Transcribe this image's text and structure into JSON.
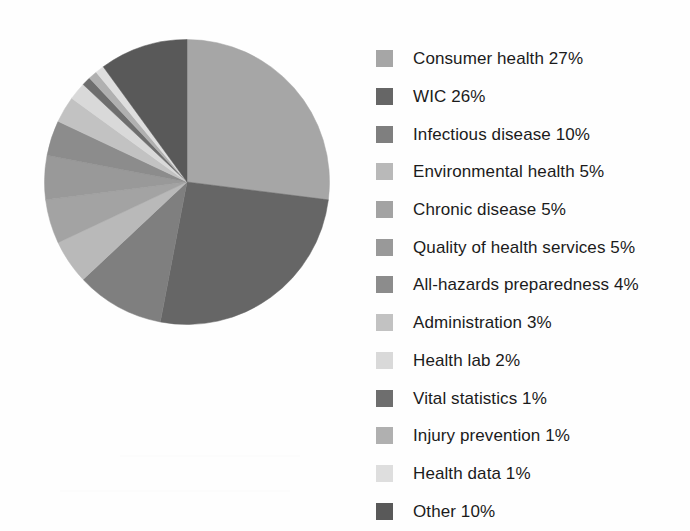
{
  "chart_data": {
    "type": "pie",
    "title": "",
    "subtitle": "",
    "xlabel": "",
    "ylabel": "",
    "legend_position": "right",
    "grid": false,
    "start_angle_deg": 0,
    "direction": "clockwise",
    "units": "percent",
    "total": 100,
    "categories": [
      "Consumer health",
      "WIC",
      "Infectious disease",
      "Environmental health",
      "Chronic disease",
      "Quality of health services",
      "All-hazards preparedness",
      "Administration",
      "Health lab",
      "Vital statistics",
      "Injury prevention",
      "Health data",
      "Other"
    ],
    "values": [
      27,
      26,
      10,
      5,
      5,
      5,
      4,
      3,
      2,
      1,
      1,
      1,
      10
    ],
    "colors": [
      "#a6a6a6",
      "#666666",
      "#7f7f7f",
      "#b9b9b9",
      "#a3a3a3",
      "#999999",
      "#8c8c8c",
      "#c2c2c2",
      "#d9d9d9",
      "#6e6e6e",
      "#b0b0b0",
      "#dedede",
      "#595959"
    ],
    "slices": [
      {
        "label": "Consumer health",
        "value": 27,
        "display": "27%",
        "color": "#a6a6a6"
      },
      {
        "label": "WIC",
        "value": 26,
        "display": "26%",
        "color": "#666666"
      },
      {
        "label": "Infectious disease",
        "value": 10,
        "display": "10%",
        "color": "#7f7f7f"
      },
      {
        "label": "Environmental health",
        "value": 5,
        "display": "5%",
        "color": "#b9b9b9"
      },
      {
        "label": "Chronic disease",
        "value": 5,
        "display": "5%",
        "color": "#a3a3a3"
      },
      {
        "label": "Quality of health services",
        "value": 5,
        "display": "5%",
        "color": "#999999"
      },
      {
        "label": "All-hazards preparedness",
        "value": 4,
        "display": "4%",
        "color": "#8c8c8c"
      },
      {
        "label": "Administration",
        "value": 3,
        "display": "3%",
        "color": "#c2c2c2"
      },
      {
        "label": "Health lab",
        "value": 2,
        "display": "2%",
        "color": "#d9d9d9"
      },
      {
        "label": "Vital statistics",
        "value": 1,
        "display": "1%",
        "color": "#6e6e6e"
      },
      {
        "label": "Injury prevention",
        "value": 1,
        "display": "1%",
        "color": "#b0b0b0"
      },
      {
        "label": "Health data",
        "value": 1,
        "display": "1%",
        "color": "#dedede"
      },
      {
        "label": "Other",
        "value": 10,
        "display": "10%",
        "color": "#595959"
      }
    ]
  },
  "legend": {
    "items": [
      {
        "text": "Consumer health 27%",
        "color": "#a6a6a6"
      },
      {
        "text": "WIC 26%",
        "color": "#666666"
      },
      {
        "text": "Infectious disease 10%",
        "color": "#7f7f7f"
      },
      {
        "text": "Environmental health 5%",
        "color": "#b9b9b9"
      },
      {
        "text": "Chronic disease 5%",
        "color": "#a3a3a3"
      },
      {
        "text": "Quality of health services 5%",
        "color": "#999999"
      },
      {
        "text": "All-hazards preparedness 4%",
        "color": "#8c8c8c"
      },
      {
        "text": "Administration 3%",
        "color": "#c2c2c2"
      },
      {
        "text": "Health lab 2%",
        "color": "#d9d9d9"
      },
      {
        "text": "Vital statistics 1%",
        "color": "#6e6e6e"
      },
      {
        "text": "Injury prevention 1%",
        "color": "#b0b0b0"
      },
      {
        "text": "Health data 1%",
        "color": "#dedede"
      },
      {
        "text": "Other 10%",
        "color": "#595959"
      }
    ]
  }
}
